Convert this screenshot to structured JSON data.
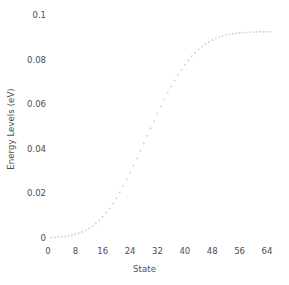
{
  "chart_data": {
    "type": "scatter",
    "title": "",
    "xlabel": "State",
    "ylabel": "Energy Levels (eV)",
    "xlim": [
      0,
      66
    ],
    "ylim": [
      0,
      0.1
    ],
    "xticks": [
      "0",
      "8",
      "16",
      "24",
      "32",
      "40",
      "48",
      "56",
      "64"
    ],
    "xtick_values": [
      0,
      8,
      16,
      24,
      32,
      40,
      48,
      56,
      64
    ],
    "yticks": [
      "0",
      "0.02",
      "0.04",
      "0.06",
      "0.08",
      "0.1"
    ],
    "ytick_values": [
      0,
      0.02,
      0.04,
      0.06,
      0.08,
      0.1
    ],
    "grid": false,
    "legend": false,
    "marker": "dotted",
    "series": [
      {
        "name": "Energy Levels",
        "color": "#d2d2d2",
        "x": [
          1,
          2,
          3,
          4,
          5,
          6,
          7,
          8,
          9,
          10,
          11,
          12,
          13,
          14,
          15,
          16,
          17,
          18,
          19,
          20,
          21,
          22,
          23,
          24,
          25,
          26,
          27,
          28,
          29,
          30,
          31,
          32,
          33,
          34,
          35,
          36,
          37,
          38,
          39,
          40,
          41,
          42,
          43,
          44,
          45,
          46,
          47,
          48,
          49,
          50,
          51,
          52,
          53,
          54,
          55,
          56,
          57,
          58,
          59,
          60,
          61,
          62,
          63,
          64,
          65
        ],
        "values": [
          0.0002,
          0.0003,
          0.0004,
          0.0005,
          0.0007,
          0.0009,
          0.0012,
          0.0016,
          0.0021,
          0.0027,
          0.0034,
          0.0043,
          0.0053,
          0.0065,
          0.0079,
          0.0095,
          0.0113,
          0.0133,
          0.0155,
          0.0179,
          0.0205,
          0.0233,
          0.0262,
          0.0293,
          0.0325,
          0.0357,
          0.0391,
          0.0424,
          0.0458,
          0.0492,
          0.0525,
          0.0558,
          0.059,
          0.0621,
          0.0651,
          0.0679,
          0.0706,
          0.0731,
          0.0755,
          0.0777,
          0.0797,
          0.0815,
          0.0831,
          0.0846,
          0.0859,
          0.087,
          0.088,
          0.0888,
          0.0895,
          0.0901,
          0.0906,
          0.091,
          0.0913,
          0.0916,
          0.0918,
          0.092,
          0.0921,
          0.0922,
          0.0923,
          0.0924,
          0.0924,
          0.0925,
          0.0925,
          0.0925,
          0.0925
        ]
      }
    ]
  }
}
